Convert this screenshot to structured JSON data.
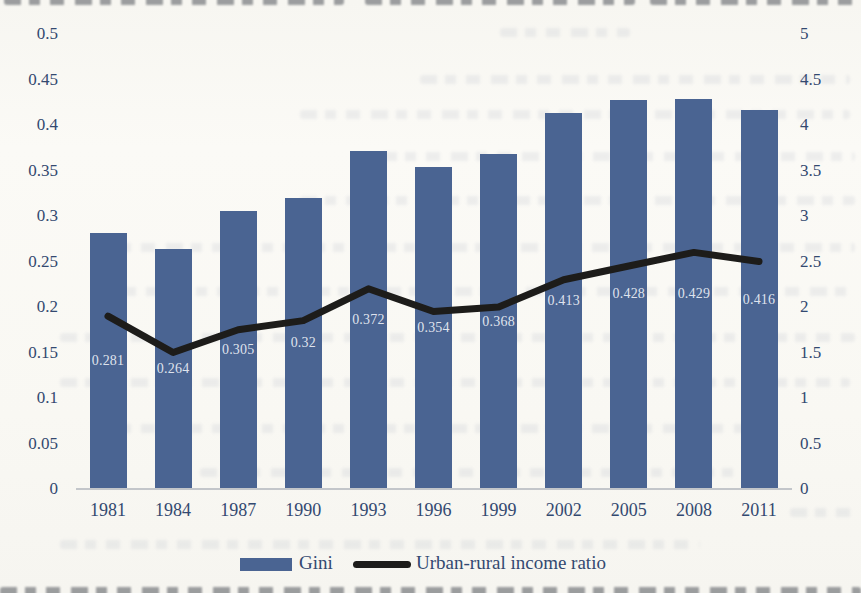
{
  "colors": {
    "paper": "#f9f8f4",
    "bar": "#4a6492",
    "line": "#1d1c1a",
    "axis_text": "#334970",
    "bar_label_text": "#eef1f7",
    "baseline": "#c3c6ca"
  },
  "chart_data": {
    "type": "bar+line combo",
    "title": "",
    "categories": [
      "1981",
      "1984",
      "1987",
      "1990",
      "1993",
      "1996",
      "1999",
      "2002",
      "2005",
      "2008",
      "2011"
    ],
    "series": [
      {
        "name": "Gini",
        "type": "bar",
        "axis": "left",
        "color": "#4a6492",
        "values": [
          0.281,
          0.264,
          0.305,
          0.32,
          0.372,
          0.354,
          0.368,
          0.413,
          0.428,
          0.429,
          0.416
        ],
        "data_labels": [
          "0.281",
          "0.264",
          "0.305",
          "0.32",
          "0.372",
          "0.354",
          "0.368",
          "0.413",
          "0.428",
          "0.429",
          "0.416"
        ]
      },
      {
        "name": "Urban-rural income ratio",
        "type": "line",
        "axis": "right",
        "color": "#1d1c1a",
        "values": [
          1.9,
          1.5,
          1.75,
          1.85,
          2.2,
          1.95,
          2.0,
          2.3,
          2.45,
          2.6,
          2.5
        ]
      }
    ],
    "left_axis": {
      "min": 0,
      "max": 0.5,
      "step": 0.05,
      "ticks": [
        "0.5",
        "0.45",
        "0.4",
        "0.35",
        "0.3",
        "0.25",
        "0.2",
        "0.15",
        "0.1",
        "0.05",
        "0"
      ]
    },
    "right_axis": {
      "min": 0,
      "max": 5,
      "step": 0.5,
      "ticks": [
        "5",
        "4.5",
        "4",
        "3.5",
        "3",
        "2.5",
        "2",
        "1.5",
        "1",
        "0.5",
        "0"
      ]
    },
    "grid": false,
    "legend_position": "bottom",
    "legend": [
      "Gini",
      "Urban-rural income ratio"
    ]
  }
}
